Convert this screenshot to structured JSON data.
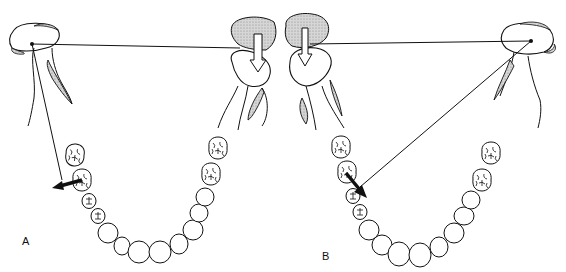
{
  "figure": {
    "type": "dental mandibular arch diagram",
    "panels": [
      {
        "id": "A",
        "label": "A",
        "description": "Working condyle left; line from condyle rotation center to first molar; arrow pointing laterally (buccal) from lower first molar",
        "rotation_center": [
          32,
          44
        ],
        "line_to": [
          74,
          210
        ],
        "arrow": {
          "from": [
            80,
            188
          ],
          "to": [
            54,
            198
          ]
        }
      },
      {
        "id": "B",
        "label": "B",
        "description": "Rotation center at right condyle; line to lower left first molar; arrow pointing lingually/distal",
        "rotation_center": [
          531,
          41
        ],
        "line_to": [
          357,
          187
        ],
        "arrow": {
          "from": [
            345,
            172
          ],
          "to": [
            366,
            197
          ]
        }
      }
    ],
    "colors": {
      "stroke": "#111111",
      "shade": "#bdbdbd",
      "background": "#ffffff"
    }
  }
}
